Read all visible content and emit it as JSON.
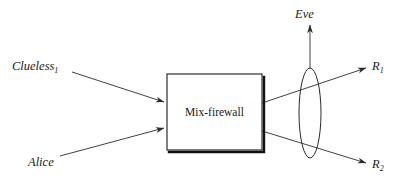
{
  "diagram": {
    "type": "block-flow-diagram",
    "background_color": "#ffffff",
    "stroke_color": "#2b2b2b",
    "nodes": {
      "mix_firewall": {
        "label": "Mix-firewall",
        "shape": "rectangle-with-shadow"
      },
      "clueless": {
        "label": "Clueless",
        "subscript": "1",
        "role": "input-sender"
      },
      "alice": {
        "label": "Alice",
        "subscript": "",
        "role": "input-sender"
      },
      "eve": {
        "label": "Eve",
        "subscript": "",
        "role": "eavesdropper"
      },
      "r1": {
        "label": "R",
        "subscript": "1",
        "role": "output-recipient"
      },
      "r2": {
        "label": "R",
        "subscript": "2",
        "role": "output-recipient"
      },
      "wiretap": {
        "label": "",
        "shape": "vertical-ellipse",
        "role": "observation-point"
      }
    },
    "edges": [
      {
        "name": "clueless-to-mix",
        "from": "clueless",
        "to": "mix_firewall",
        "arrow": true
      },
      {
        "name": "alice-to-mix",
        "from": "alice",
        "to": "mix_firewall",
        "arrow": true
      },
      {
        "name": "mix-to-r1",
        "from": "mix_firewall",
        "to": "r1",
        "arrow": true
      },
      {
        "name": "mix-to-r2",
        "from": "mix_firewall",
        "to": "r2",
        "arrow": true
      },
      {
        "name": "wiretap-to-eve",
        "from": "wiretap",
        "to": "eve",
        "arrow": true
      }
    ]
  }
}
